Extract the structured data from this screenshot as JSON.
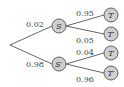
{
  "diagram": {
    "type": "probability-tree",
    "root": {
      "x": 10,
      "y": 45
    },
    "level1": [
      {
        "id": "S",
        "label": "S",
        "prob": "0.02",
        "x": 59,
        "y": 26,
        "lx": 26,
        "ly": 27
      },
      {
        "id": "S'",
        "label": "S′",
        "prob": "0.98",
        "x": 59,
        "y": 64,
        "lx": 26,
        "ly": 67
      }
    ],
    "level2": [
      {
        "parent": "S",
        "label": "T",
        "prob": "0.95",
        "x": 111,
        "y": 15,
        "lx": 76,
        "ly": 16
      },
      {
        "parent": "S",
        "label": "T′",
        "prob": "0.05",
        "x": 111,
        "y": 34,
        "lx": 76,
        "ly": 43
      },
      {
        "parent": "S'",
        "label": "T",
        "prob": "0.04",
        "x": 111,
        "y": 53,
        "lx": 76,
        "ly": 55
      },
      {
        "parent": "S'",
        "label": "T′",
        "prob": "0.96",
        "x": 111,
        "y": 73,
        "lx": 76,
        "ly": 82
      }
    ]
  }
}
